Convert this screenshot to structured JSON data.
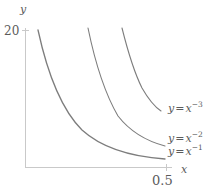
{
  "chart_data": {
    "type": "line",
    "title": "",
    "xlabel": "x",
    "ylabel": "y",
    "xlim": [
      0,
      0.55
    ],
    "ylim": [
      0,
      22
    ],
    "grid": false,
    "legend_position": "inline-right",
    "axis_color": "#c9c9c9",
    "curve_color": "#7d7d7d",
    "text_color": "#5b5b5b",
    "x_ticks": [
      {
        "value": 0.5,
        "label": "0.5"
      }
    ],
    "y_ticks": [
      {
        "value": 20,
        "label": "20"
      }
    ],
    "series": [
      {
        "name": "y = x^-3",
        "label_base": "y",
        "label_eq": "=",
        "label_var": "x",
        "label_exp": "−3",
        "exponent": -3,
        "path": "M 122,28 C 128,52 134,72 142,88 C 150,102 155,107 161,111"
      },
      {
        "name": "y = x^-2",
        "label_base": "y",
        "label_eq": "=",
        "label_var": "x",
        "label_exp": "−2",
        "exponent": -2,
        "path": "M 88,28 C 95,62 104,92 118,116 C 132,134 150,142 165,146"
      },
      {
        "name": "y = x^-1",
        "label_base": "y",
        "label_eq": "=",
        "label_var": "x",
        "label_exp": "−1",
        "exponent": -1,
        "path": "M 38,30 C 48,76 62,110 82,130 C 104,150 136,157 165,159"
      }
    ]
  },
  "figure": {
    "y_axis_label": "y",
    "x_axis_label": "x",
    "y_tick_20": "20",
    "x_tick_05": "0.5"
  }
}
